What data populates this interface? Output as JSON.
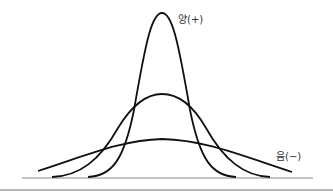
{
  "diagram": {
    "title": "",
    "labels": {
      "positive": "양(+)",
      "negative": "음(−)"
    },
    "curves": [
      {
        "name": "leptokurtic",
        "label": "양(+)",
        "peak": "tall, narrow"
      },
      {
        "name": "mesokurtic",
        "label": "",
        "peak": "medium"
      },
      {
        "name": "platykurtic",
        "label": "음(−)",
        "peak": "flat, wide"
      }
    ],
    "colors": {
      "curve": "#111111",
      "baseline": "#888888",
      "divider": "#999999",
      "text": "#333333"
    }
  }
}
